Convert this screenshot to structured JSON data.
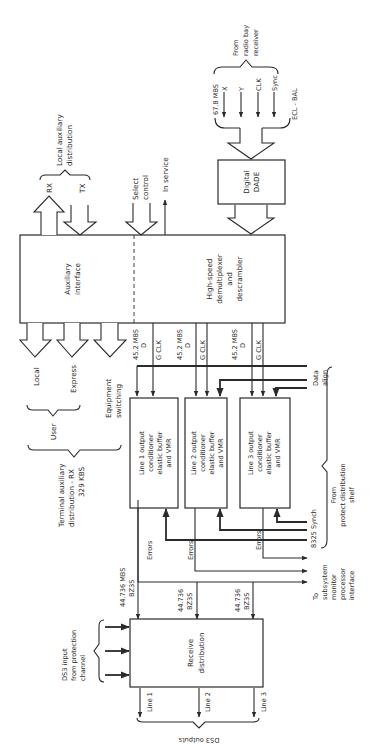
{
  "blocks": {
    "auxiliary_interface": "Auxiliary interface",
    "high_speed": [
      "High-speed",
      "demultiplexer",
      "and",
      "descrambler"
    ],
    "digital_dade": [
      "Digital",
      "DADE"
    ],
    "line1": [
      "Line 1 output",
      "conditioner",
      "elastic buffer",
      "and VMR"
    ],
    "line2": [
      "Line 2 output",
      "conditioner",
      "elastic buffer",
      "and VMR"
    ],
    "line3": [
      "Line 3 output",
      "conditioner",
      "elastic buffer",
      "and VMR"
    ],
    "receive_distribution": [
      "Receive",
      "distribution"
    ]
  },
  "inputs": {
    "from_radio_bay": [
      "From",
      "radio bay",
      "receiver"
    ],
    "rate": "67.8 MBS",
    "signals": [
      "X",
      "Y",
      "CLK",
      "Sync"
    ],
    "ecl": "ECL - BAL"
  },
  "local_aux": {
    "title": [
      "Local auxiliary",
      "distribution"
    ],
    "rx": "RX",
    "tx": "TX"
  },
  "control": {
    "select": [
      "Select",
      "control"
    ],
    "in_service": "In service"
  },
  "terminal_aux": {
    "local": "Local",
    "express": "Express",
    "equipment": [
      "Equipment",
      "switching"
    ],
    "user": "User",
    "title": [
      "Terminal auxiliary",
      "distribution - RX",
      "329 KBS"
    ]
  },
  "bus_labels": {
    "rate": "45.2 MBS",
    "d": "D",
    "gclk": "G CLK"
  },
  "protect": {
    "data_align": [
      "Data",
      "align"
    ],
    "synch": "8325 Synch",
    "from_shelf": [
      "From",
      "protect distribution",
      "shelf"
    ]
  },
  "errors_label": "Errors",
  "subsystem": [
    "To",
    "subsystem",
    "monitor",
    "processor",
    "interface"
  ],
  "ds3": {
    "rate1": [
      "44.736 MBS",
      "BZ3S"
    ],
    "rate2": [
      "44.736",
      "BZ3S"
    ],
    "rate3": [
      "44.736",
      "BZ3S"
    ],
    "input": [
      "DS3 input",
      "from protection",
      "channel"
    ],
    "lines": [
      "Line 1",
      "Line 2",
      "Line 3"
    ],
    "outputs": "DS3 outputs"
  }
}
